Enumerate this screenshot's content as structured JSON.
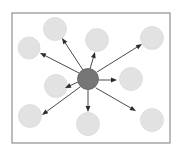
{
  "figure": {
    "caption": "",
    "canvas": {
      "width": 183,
      "height": 159,
      "background": "#ffffff"
    }
  },
  "frame": {
    "name": "diagram-border",
    "x": 12,
    "y": 13,
    "width": 158,
    "height": 130,
    "stroke": "#8f8f8f",
    "stroke_width": 1.2,
    "fill": "#ffffff"
  },
  "style": {
    "center_fill": "#767676",
    "center_stroke": "#5a5a5a",
    "satellite_fill": "#e2e2e2",
    "satellite_stroke": "#dadada",
    "arrow_stroke": "#4a4a4a",
    "arrow_stroke_width": 1.0,
    "arrowhead_fill": "#2b2b2b"
  },
  "center_node": {
    "label": "central-node",
    "cx": 88,
    "cy": 79,
    "r": 10.5
  },
  "satellite_nodes": [
    {
      "label": "node-top-left",
      "cx": 29,
      "cy": 48,
      "r": 11
    },
    {
      "label": "node-top-center",
      "cx": 55,
      "cy": 29,
      "r": 11.5
    },
    {
      "label": "node-top-right-in",
      "cx": 97,
      "cy": 40,
      "r": 11.5
    },
    {
      "label": "node-top-right",
      "cx": 152,
      "cy": 38,
      "r": 11.5
    },
    {
      "label": "node-mid-left",
      "cx": 56,
      "cy": 86,
      "r": 11.5
    },
    {
      "label": "node-mid-right",
      "cx": 131,
      "cy": 79,
      "r": 11.5
    },
    {
      "label": "node-bottom-left",
      "cx": 30,
      "cy": 116,
      "r": 11.5
    },
    {
      "label": "node-bottom-center",
      "cx": 88,
      "cy": 124,
      "r": 11.5
    },
    {
      "label": "node-bottom-right",
      "cx": 152,
      "cy": 120,
      "r": 11.5
    }
  ],
  "arrows": [
    {
      "label": "arrow-to-top-center",
      "x1": 83,
      "y1": 70,
      "x2": 62,
      "y2": 38
    },
    {
      "label": "arrow-to-top-right-in",
      "x1": 90,
      "y1": 69,
      "x2": 95,
      "y2": 52
    },
    {
      "label": "arrow-to-top-right",
      "x1": 97,
      "y1": 72,
      "x2": 142,
      "y2": 44
    },
    {
      "label": "arrow-to-top-left",
      "x1": 79,
      "y1": 73,
      "x2": 40,
      "y2": 53
    },
    {
      "label": "arrow-to-mid-left",
      "x1": 78,
      "y1": 82,
      "x2": 65,
      "y2": 88
    },
    {
      "label": "arrow-to-mid-right",
      "x1": 99,
      "y1": 80,
      "x2": 117,
      "y2": 80
    },
    {
      "label": "arrow-to-bottom-left",
      "x1": 80,
      "y1": 87,
      "x2": 42,
      "y2": 115
    },
    {
      "label": "arrow-to-bottom-center",
      "x1": 88,
      "y1": 90,
      "x2": 88,
      "y2": 112
    },
    {
      "label": "arrow-to-bottom-right",
      "x1": 96,
      "y1": 88,
      "x2": 136,
      "y2": 111
    }
  ]
}
